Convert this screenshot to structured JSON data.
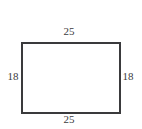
{
  "figure": {
    "kind": "rectangle-dimension-diagram",
    "shape": "rectangle",
    "background_color": "#ffffff",
    "stroke_color": "#3a3a3c",
    "stroke_width_px": 2,
    "label_color": "#3b3b3d",
    "labels": {
      "top": "25",
      "bottom": "25",
      "left": "18",
      "right": "18"
    }
  },
  "chart_data": {
    "type": "diagram",
    "shape": "rectangle",
    "title": "",
    "xlabel": "",
    "ylabel": "",
    "annotations": [
      {
        "side": "top",
        "value": "25",
        "position": "above-top-edge"
      },
      {
        "side": "left",
        "value": "18",
        "position": "left-of-left-edge"
      },
      {
        "side": "right",
        "value": "18",
        "position": "right-of-right-edge"
      },
      {
        "side": "bottom",
        "value": "25",
        "position": "below-bottom-edge"
      }
    ],
    "width_label": "25",
    "height_label": "18"
  }
}
